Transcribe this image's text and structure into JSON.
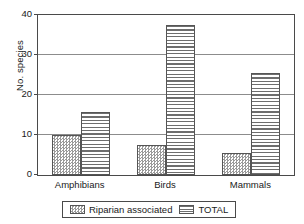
{
  "chart_data": {
    "type": "bar",
    "title": "",
    "xlabel": "",
    "ylabel": "No. species",
    "categories": [
      "Amphibians",
      "Birds",
      "Mammals"
    ],
    "series": [
      {
        "name": "Riparian associated",
        "values": [
          10,
          7.4,
          5.4
        ]
      },
      {
        "name": "TOTAL",
        "values": [
          15.8,
          37.5,
          25.4
        ]
      }
    ],
    "ylim": [
      0,
      40
    ],
    "yticks": [
      0,
      10,
      20,
      30,
      40
    ],
    "ytick_labels": [
      "0",
      "10",
      "20",
      "30",
      "40"
    ],
    "grid": true,
    "legend_position": "bottom",
    "legend_entries": [
      "Riparian associated",
      "TOTAL"
    ]
  }
}
